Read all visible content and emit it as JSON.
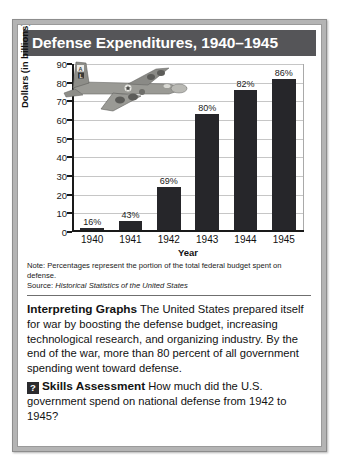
{
  "title": "Defense Expenditures, 1940–1945",
  "chart_data": {
    "type": "bar",
    "title": "Defense Expenditures, 1940–1945",
    "categories": [
      "1940",
      "1941",
      "1942",
      "1943",
      "1944",
      "1945"
    ],
    "values": [
      2,
      6,
      24,
      63,
      76,
      82
    ],
    "data_labels": [
      "16%",
      "43%",
      "69%",
      "80%",
      "82%",
      "86%"
    ],
    "xlabel": "Year",
    "ylabel": "Dollars (in billions)",
    "ylim": [
      0,
      90
    ],
    "yticks": [
      0,
      10,
      20,
      30,
      40,
      50,
      60,
      70,
      80,
      90
    ],
    "grid": true,
    "legend": "none",
    "bar_color": "#26262a",
    "note": "Note: Percentages represent the portion of the total federal budget spent on defense.",
    "source_label": "Source:",
    "source_title": "Historical Statistics of the United States"
  },
  "body": {
    "lead_in": "Interpreting Graphs",
    "text": " The United States prepared itself for war by boosting the defense budget, increasing technological research, and organizing industry. By the end of the war, more than 80 percent of all government spending went toward defense."
  },
  "skills": {
    "badge": "?",
    "lead_in": "Skills Assessment",
    "text": " How much did the U.S. government spend on national defense from 1942 to 1945?"
  },
  "illustration": {
    "name": "b17-bomber-aircraft"
  }
}
